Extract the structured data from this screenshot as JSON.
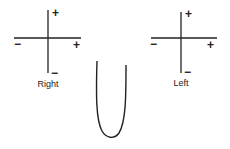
{
  "diagram": {
    "left_axes": {
      "label": "Right",
      "top_sign": "+",
      "bottom_sign": "−",
      "left_sign": "−",
      "right_sign": "+"
    },
    "right_axes": {
      "label": "Left",
      "top_sign": "+",
      "bottom_sign": "−",
      "left_sign": "−",
      "right_sign": "+"
    },
    "curve": {
      "shape": "U-shaped curve"
    },
    "colors": {
      "stroke": "#222222",
      "background": "#ffffff"
    }
  }
}
